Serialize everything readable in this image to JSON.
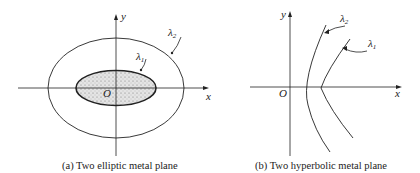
{
  "figure_a": {
    "caption": "(a) Two elliptic metal plane",
    "axis_x_label": "x",
    "axis_y_label": "y",
    "origin_label": "O",
    "outer_label": "λ",
    "outer_sub": "2",
    "inner_label": "λ",
    "inner_sub": "1"
  },
  "figure_b": {
    "caption": "(b) Two hyperbolic metal plane",
    "axis_x_label": "x",
    "axis_y_label": "y",
    "origin_label": "O",
    "curve2_label": "λ",
    "curve2_sub": "2",
    "curve1_label": "λ",
    "curve1_sub": "1"
  },
  "colors": {
    "stroke": "#222222",
    "fill_inner": "#d6d6d6",
    "background": "#ffffff"
  }
}
